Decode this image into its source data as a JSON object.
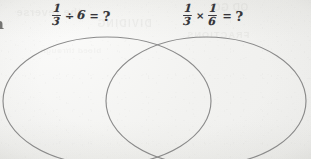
{
  "page": {
    "kind": "scanned-math-worksheet",
    "width": 311,
    "height": 159,
    "paper_color": "#f5f5f3",
    "ink_color": "#35343a",
    "ellipse_stroke_color": "#8b8b8b"
  },
  "equations": {
    "division": {
      "name": "one-third divided by six",
      "numerator_1": "1",
      "denominator_1": "3",
      "operator": "÷",
      "operand_2": "6",
      "equals": "=",
      "answer": "?",
      "plain_text": "1/3 ÷ 6 = ?"
    },
    "multiplication": {
      "name": "one-third times one-sixth",
      "numerator_1": "1",
      "denominator_1": "3",
      "operator": "×",
      "numerator_2": "1",
      "denominator_2": "6",
      "equals": "=",
      "answer": "?",
      "plain_text": "1/3 × 1/6 = ?"
    }
  },
  "edge_fragment": {
    "glyph": "n"
  },
  "venn": {
    "left_ellipse": {
      "cx": 107,
      "cy": 101,
      "rx": 104,
      "ry": 64
    },
    "right_ellipse": {
      "cx": 206,
      "cy": 101,
      "rx": 100,
      "ry": 64
    },
    "label": "two overlapping ellipses forming a venn diagram"
  },
  "ghost_text": {
    "line_1": "the reverse",
    "line_2": "DIVIDING",
    "line_3": "FRACTIONS",
    "line_4": "OD GO",
    "line_5": "bleed through"
  }
}
